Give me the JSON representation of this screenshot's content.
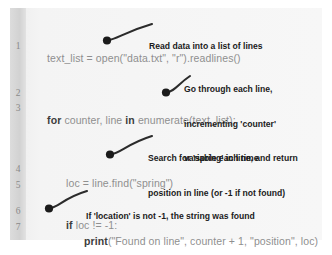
{
  "document": {
    "kind": "annotated-code-listing",
    "language": "python",
    "gutter_color": "#d8d8d8",
    "panel_color": "#f2f2f2",
    "code_color": "#a9a9a9",
    "keyword_color": "#3c3c3c",
    "annotation_color": "#1b1b1b"
  },
  "line_numbers": [
    "1",
    "2",
    "3",
    "4",
    "5",
    "6",
    "7"
  ],
  "code_lines": [
    {
      "number": "1",
      "indent": 0,
      "segments": [
        {
          "text": "text_list = open(\"data.txt\", \"r\").readlines()",
          "bold": false
        }
      ]
    },
    {
      "number": "3",
      "indent": 0,
      "segments": [
        {
          "text": "for",
          "bold": true
        },
        {
          "text": " counter, line ",
          "bold": false
        },
        {
          "text": "in",
          "bold": true
        },
        {
          "text": " enumerate(text_list):",
          "bold": false
        }
      ]
    },
    {
      "number": "4",
      "indent": 1,
      "segments": [
        {
          "text": "loc = line.find(\"spring\")",
          "bold": false
        }
      ]
    },
    {
      "number": "6",
      "indent": 1,
      "segments": [
        {
          "text": "if",
          "bold": true
        },
        {
          "text": " loc != -1:",
          "bold": false
        }
      ]
    },
    {
      "number": "7",
      "indent": 2,
      "segments": [
        {
          "text": "print",
          "bold": true
        },
        {
          "text": "(\"Found on line\", counter + 1, \"position\", loc)",
          "bold": false
        }
      ]
    }
  ],
  "annotations": [
    {
      "id": "read-data",
      "lines": [
        "Read data into a list of lines"
      ]
    },
    {
      "id": "loop-counter",
      "lines": [
        "Go through each line,",
        "incrementing 'counter'",
        "variable each time"
      ]
    },
    {
      "id": "find-spring",
      "lines": [
        "Search for 'spring' in line, and return",
        "position in line (or -1 if not found)"
      ]
    },
    {
      "id": "location-check",
      "lines": [
        "If 'location' is not -1, the string was found"
      ]
    }
  ],
  "full_code_text": "text_list = open(\"data.txt\", \"r\").readlines()\n\nfor counter, line in enumerate(text_list):\n    loc = line.find(\"spring\")\n\n    if loc != -1:\n        print(\"Found on line\", counter + 1, \"position\", loc)"
}
